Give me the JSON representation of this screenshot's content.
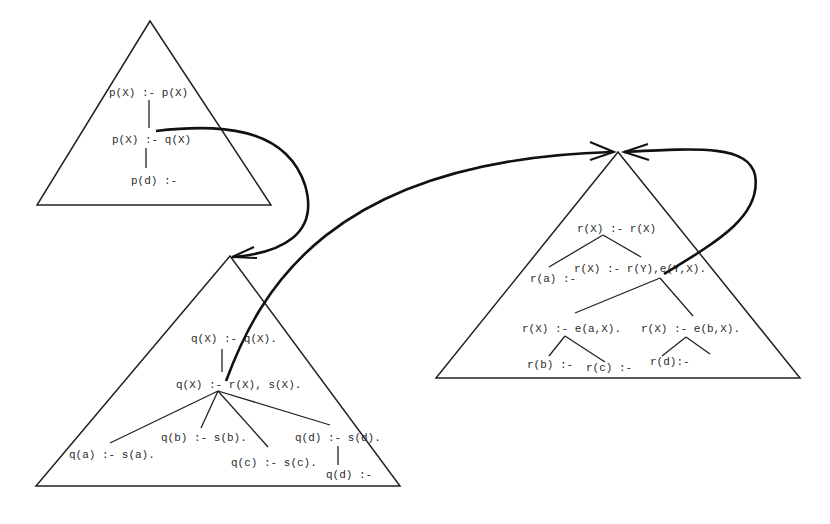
{
  "diagram": {
    "type": "proof-tree / SLD-tree triangles with recursive call arcs",
    "trees": [
      {
        "id": "p-tree",
        "nodes": [
          {
            "id": "p1",
            "label": "p(X) :- p(X)"
          },
          {
            "id": "p2",
            "label": "p(X) :- q(X)"
          },
          {
            "id": "p3",
            "label": "p(d) :-"
          }
        ],
        "edges": [
          [
            "p1",
            "p2"
          ],
          [
            "p2",
            "p3"
          ]
        ]
      },
      {
        "id": "q-tree",
        "nodes": [
          {
            "id": "q1",
            "label": "q(X) :- q(X)."
          },
          {
            "id": "q2",
            "label": "q(X) :- r(X), s(X)."
          },
          {
            "id": "q3",
            "label": "q(a) :- s(a)."
          },
          {
            "id": "q4",
            "label": "q(b) :- s(b)."
          },
          {
            "id": "q5",
            "label": "q(c) :- s(c)."
          },
          {
            "id": "q6",
            "label": "q(d) :- s(d)."
          },
          {
            "id": "q7",
            "label": "q(d) :-"
          }
        ],
        "edges": [
          [
            "q1",
            "q2"
          ],
          [
            "q2",
            "q3"
          ],
          [
            "q2",
            "q4"
          ],
          [
            "q2",
            "q5"
          ],
          [
            "q2",
            "q6"
          ],
          [
            "q6",
            "q7"
          ]
        ]
      },
      {
        "id": "r-tree",
        "nodes": [
          {
            "id": "r1",
            "label": "r(X) :- r(X)"
          },
          {
            "id": "r2",
            "label": "r(a) :-"
          },
          {
            "id": "r3",
            "label": "r(X) :- r(Y),e(Y,X)."
          },
          {
            "id": "r4",
            "label": "r(X) :- e(a,X)."
          },
          {
            "id": "r5",
            "label": "r(X) :- e(b,X)."
          },
          {
            "id": "r6",
            "label": "r(b) :-"
          },
          {
            "id": "r7",
            "label": "r(c) :-"
          },
          {
            "id": "r8",
            "label": "r(d):-"
          }
        ],
        "edges": [
          [
            "r1",
            "r2"
          ],
          [
            "r1",
            "r3"
          ],
          [
            "r3",
            "r4"
          ],
          [
            "r3",
            "r5"
          ],
          [
            "r4",
            "r6"
          ],
          [
            "r4",
            "r7"
          ],
          [
            "r5",
            "r8"
          ]
        ]
      }
    ],
    "arcs": [
      {
        "from": "p2",
        "to": "q-tree",
        "description": "call q(X) from p-tree into q-tree root"
      },
      {
        "from": "q2",
        "to": "r-tree",
        "description": "call r(X) from q-tree into r-tree root"
      },
      {
        "from": "r3",
        "to": "r-tree",
        "description": "recursive call r(Y) back to r-tree root"
      }
    ]
  }
}
